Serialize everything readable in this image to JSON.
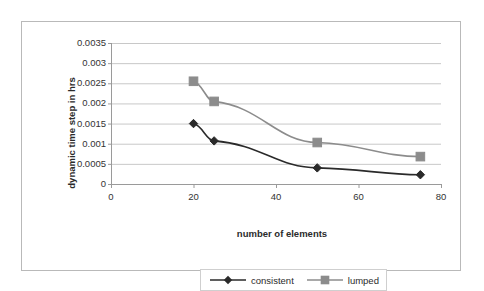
{
  "chart_data": {
    "type": "line",
    "title": "",
    "xlabel": "number of elements",
    "ylabel": "dynamic time step in hrs",
    "xlim": [
      0,
      80
    ],
    "ylim": [
      0,
      0.0035
    ],
    "grid": "horizontal",
    "legend_position": "bottom",
    "x_ticks": [
      "0",
      "20",
      "40",
      "60",
      "80"
    ],
    "x_tick_values": [
      0,
      20,
      40,
      60,
      80
    ],
    "y_ticks": [
      "0",
      "0.0005",
      "0.001",
      "0.0015",
      "0.002",
      "0.0025",
      "0.003",
      "0.0035"
    ],
    "y_tick_values": [
      0,
      0.0005,
      0.001,
      0.0015,
      0.002,
      0.0025,
      0.003,
      0.0035
    ],
    "x": [
      20,
      25,
      50,
      75
    ],
    "series": [
      {
        "name": "consistent",
        "marker": "diamond",
        "color": "#2a2a2a",
        "values": [
          0.0015,
          0.00107,
          0.0004,
          0.00023
        ]
      },
      {
        "name": "lumped",
        "marker": "square",
        "color": "#8c8c8c",
        "values": [
          0.00255,
          0.00205,
          0.00103,
          0.00068
        ]
      }
    ]
  },
  "colors": {
    "frame_border": "#b9b9b9",
    "gridline": "#c8c8c8",
    "axis_line": "#9a9a9a",
    "consistent": "#2a2a2a",
    "lumped": "#8c8c8c",
    "text": "#2b2b2b"
  },
  "legend": {
    "entries": [
      {
        "label": "consistent"
      },
      {
        "label": "lumped"
      }
    ]
  }
}
